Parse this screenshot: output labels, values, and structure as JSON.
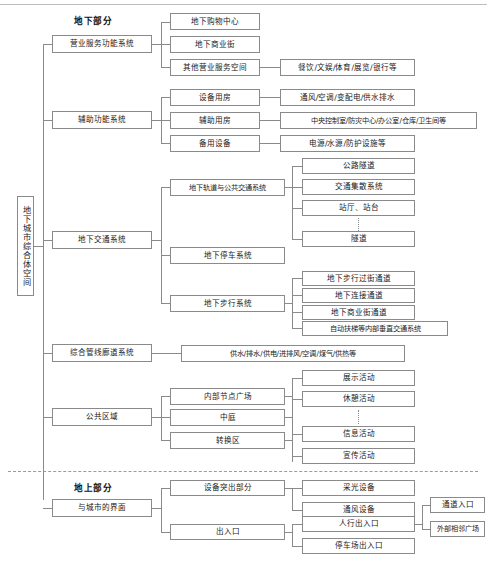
{
  "diagram": {
    "title": "地下城市综合体空间",
    "section_labels": {
      "underground": "地下部分",
      "aboveground": "地上部分"
    },
    "root": {
      "label": "地下城市综合体空间"
    },
    "branches": [
      {
        "label": "营业服务功能系统",
        "children": [
          {
            "label": "地下购物中心",
            "children": []
          },
          {
            "label": "地下商业街",
            "children": []
          },
          {
            "label": "其他营业服务空间",
            "children": [
              {
                "label": "餐饮/文娱/体育/展览/银行等"
              }
            ]
          }
        ]
      },
      {
        "label": "辅助功能系统",
        "children": [
          {
            "label": "设备用房",
            "children": [
              {
                "label": "通风/空调/变配电/供水排水"
              }
            ]
          },
          {
            "label": "辅助用房",
            "children": [
              {
                "label": "中央控制室/防灾中心/办公室/仓库/卫生间等"
              }
            ]
          },
          {
            "label": "备用设备",
            "children": [
              {
                "label": "电源/水源/防护设施等"
              }
            ]
          }
        ]
      },
      {
        "label": "地下交通系统",
        "children": [
          {
            "label": "地下轨道与公共交通系统",
            "children": [
              {
                "label": "公路隧道"
              },
              {
                "label": "交通集散系统"
              },
              {
                "label": "站厅、站台"
              },
              {
                "label": "隧道"
              }
            ]
          },
          {
            "label": "地下停车系统",
            "children": []
          },
          {
            "label": "地下步行系统",
            "children": [
              {
                "label": "地下步行过街通道"
              },
              {
                "label": "地下连接通道"
              },
              {
                "label": "地下商业街通道"
              },
              {
                "label": "自动扶梯等内部垂直交通系统"
              }
            ]
          }
        ]
      },
      {
        "label": "综合管线廊道系统",
        "children": [
          {
            "label": "供水/排水/供电/进排风/空调/煤气/供热等",
            "children": []
          }
        ]
      },
      {
        "label": "公共区域",
        "children": [
          {
            "label": "内部节点广场",
            "children": []
          },
          {
            "label": "中庭",
            "children": []
          },
          {
            "label": "转换区",
            "children": []
          }
        ],
        "right_children": [
          {
            "label": "展示活动"
          },
          {
            "label": "休憩活动"
          },
          {
            "label": "信息活动"
          },
          {
            "label": "宣传活动"
          }
        ]
      },
      {
        "label": "与城市的界面",
        "children": [
          {
            "label": "设备突出部分",
            "children": [
              {
                "label": "采光设备"
              },
              {
                "label": "通风设备"
              }
            ]
          },
          {
            "label": "出入口",
            "children": [
              {
                "label": "人行出入口",
                "children": [
                  {
                    "label": "通道入口"
                  },
                  {
                    "label": "外部相邻广场"
                  }
                ]
              },
              {
                "label": "停车场出入口"
              }
            ]
          }
        ]
      }
    ],
    "colors": {
      "line": "#8a8a8a",
      "text": "#1a1a1a",
      "background": "#ffffff",
      "divider": "#9b9b9b"
    }
  }
}
